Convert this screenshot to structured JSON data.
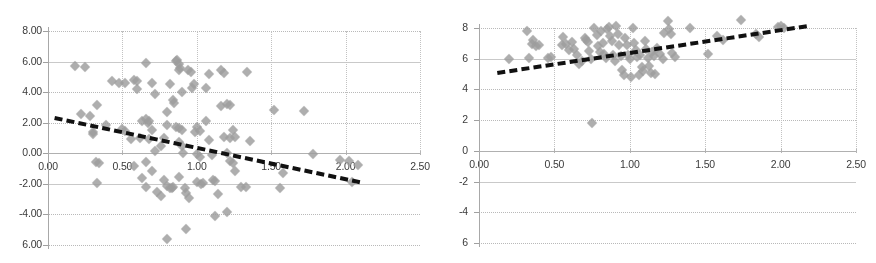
{
  "figure": {
    "type": "two-panel-scatter",
    "background": "#ffffff",
    "marker_color": "#9d9d9d",
    "trendline_color": "#111111",
    "gridline_color": "#b9b9b9"
  },
  "chart_data": [
    {
      "type": "scatter",
      "panel": "left",
      "title": "",
      "xlabel": "",
      "ylabel": "",
      "xlim": [
        0.0,
        2.5
      ],
      "ylim": [
        -6.0,
        8.0
      ],
      "grid": true,
      "legend": "none",
      "xticks": [
        "0.00",
        "0.50",
        "1.00",
        "1.50",
        "2.00",
        "2.50"
      ],
      "xtick_values": [
        0.0,
        0.5,
        1.0,
        1.5,
        2.0,
        2.5
      ],
      "yticks": [
        "8.00",
        "6.00",
        "4.00",
        "2.00",
        "0.00",
        "-2.00",
        "-4.00",
        "6.00"
      ],
      "ytick_values": [
        8,
        6,
        4,
        2,
        0,
        -2,
        -4,
        -6
      ],
      "trendline": {
        "x0": 0.05,
        "y0": 2.45,
        "x1": 2.1,
        "y1": -1.75,
        "style": "dashed",
        "slope": -2.05
      },
      "points": [
        [
          0.18,
          5.68
        ],
        [
          0.25,
          5.62
        ],
        [
          0.22,
          2.58
        ],
        [
          0.28,
          2.42
        ],
        [
          0.33,
          3.18
        ],
        [
          0.3,
          1.42
        ],
        [
          0.3,
          1.28
        ],
        [
          0.32,
          -0.55
        ],
        [
          0.34,
          -0.62
        ],
        [
          0.33,
          -1.95
        ],
        [
          0.39,
          1.85
        ],
        [
          0.43,
          4.72
        ],
        [
          0.48,
          4.58
        ],
        [
          0.52,
          4.62
        ],
        [
          0.5,
          1.62
        ],
        [
          0.52,
          1.45
        ],
        [
          0.56,
          0.95
        ],
        [
          0.58,
          4.78
        ],
        [
          0.6,
          4.72
        ],
        [
          0.6,
          4.18
        ],
        [
          0.62,
          1.02
        ],
        [
          0.63,
          -1.62
        ],
        [
          0.66,
          -2.22
        ],
        [
          0.58,
          -0.82
        ],
        [
          0.63,
          2.12
        ],
        [
          0.66,
          2.22
        ],
        [
          0.67,
          1.95
        ],
        [
          0.68,
          2.08
        ],
        [
          0.7,
          1.52
        ],
        [
          0.68,
          0.92
        ],
        [
          0.66,
          -0.55
        ],
        [
          0.7,
          -1.18
        ],
        [
          0.73,
          -2.52
        ],
        [
          0.76,
          -2.78
        ],
        [
          0.66,
          5.88
        ],
        [
          0.7,
          4.58
        ],
        [
          0.72,
          3.88
        ],
        [
          0.72,
          0.12
        ],
        [
          0.76,
          0.48
        ],
        [
          0.78,
          1.02
        ],
        [
          0.8,
          1.88
        ],
        [
          0.8,
          2.68
        ],
        [
          0.78,
          -1.72
        ],
        [
          0.8,
          -2.15
        ],
        [
          0.82,
          -2.25
        ],
        [
          0.83,
          -2.28
        ],
        [
          0.84,
          -2.18
        ],
        [
          0.8,
          -5.58
        ],
        [
          0.82,
          4.52
        ],
        [
          0.84,
          3.48
        ],
        [
          0.85,
          3.28
        ],
        [
          0.86,
          6.05
        ],
        [
          0.87,
          6.12
        ],
        [
          0.88,
          5.82
        ],
        [
          0.89,
          5.58
        ],
        [
          0.88,
          5.42
        ],
        [
          0.9,
          4.02
        ],
        [
          0.86,
          1.75
        ],
        [
          0.88,
          1.68
        ],
        [
          0.9,
          1.55
        ],
        [
          0.88,
          0.72
        ],
        [
          0.9,
          0.48
        ],
        [
          0.91,
          0.02
        ],
        [
          0.88,
          -1.58
        ],
        [
          0.92,
          -2.28
        ],
        [
          0.93,
          -2.62
        ],
        [
          0.95,
          -2.92
        ],
        [
          0.93,
          -4.98
        ],
        [
          0.94,
          5.48
        ],
        [
          0.96,
          5.32
        ],
        [
          0.98,
          4.52
        ],
        [
          0.97,
          4.28
        ],
        [
          0.99,
          1.42
        ],
        [
          1.0,
          1.72
        ],
        [
          1.02,
          1.48
        ],
        [
          1.0,
          -0.02
        ],
        [
          1.02,
          -0.22
        ],
        [
          1.0,
          -1.88
        ],
        [
          1.03,
          -2.02
        ],
        [
          1.04,
          -1.92
        ],
        [
          1.06,
          4.28
        ],
        [
          1.08,
          5.18
        ],
        [
          1.06,
          2.08
        ],
        [
          1.08,
          0.88
        ],
        [
          1.1,
          -0.12
        ],
        [
          1.11,
          -1.75
        ],
        [
          1.12,
          -1.82
        ],
        [
          1.14,
          -2.68
        ],
        [
          1.12,
          -4.12
        ],
        [
          1.16,
          5.42
        ],
        [
          1.18,
          5.28
        ],
        [
          1.16,
          3.12
        ],
        [
          1.2,
          3.22
        ],
        [
          1.22,
          3.18
        ],
        [
          1.18,
          1.08
        ],
        [
          1.22,
          1.02
        ],
        [
          1.24,
          1.52
        ],
        [
          1.26,
          1.08
        ],
        [
          1.2,
          0.05
        ],
        [
          1.22,
          -0.48
        ],
        [
          1.24,
          -0.62
        ],
        [
          1.26,
          -1.18
        ],
        [
          1.2,
          -3.82
        ],
        [
          1.3,
          -2.18
        ],
        [
          1.33,
          -2.22
        ],
        [
          1.36,
          0.82
        ],
        [
          1.34,
          5.32
        ],
        [
          1.52,
          2.82
        ],
        [
          1.56,
          -2.25
        ],
        [
          1.58,
          -1.32
        ],
        [
          1.72,
          2.75
        ],
        [
          1.78,
          -0.05
        ],
        [
          1.96,
          -0.42
        ],
        [
          2.02,
          -0.48
        ],
        [
          2.04,
          -1.88
        ],
        [
          2.08,
          -0.78
        ]
      ]
    },
    {
      "type": "scatter",
      "panel": "right",
      "title": "",
      "xlabel": "",
      "ylabel": "",
      "xlim": [
        0.0,
        2.5
      ],
      "ylim": [
        -6.0,
        8.0
      ],
      "grid": true,
      "legend": "none",
      "xticks": [
        "0.00",
        "0.50",
        "1.00",
        "1.50",
        "2.00",
        "2.50"
      ],
      "xtick_values": [
        0.0,
        0.5,
        1.0,
        1.5,
        2.0,
        2.5
      ],
      "yticks": [
        "8",
        "6",
        "4",
        "2",
        "0",
        "-2",
        "-4",
        "6"
      ],
      "ytick_values": [
        8,
        6,
        4,
        2,
        0,
        -2,
        -4,
        -6
      ],
      "trendline": {
        "x0": 0.12,
        "y0": 5.18,
        "x1": 2.17,
        "y1": 8.22,
        "style": "dashed",
        "slope": 1.48
      },
      "points": [
        [
          0.2,
          5.95
        ],
        [
          0.32,
          7.82
        ],
        [
          0.33,
          6.05
        ],
        [
          0.35,
          6.95
        ],
        [
          0.36,
          7.22
        ],
        [
          0.38,
          6.82
        ],
        [
          0.4,
          6.92
        ],
        [
          0.46,
          6.05
        ],
        [
          0.48,
          6.12
        ],
        [
          0.55,
          6.92
        ],
        [
          0.56,
          7.42
        ],
        [
          0.58,
          6.95
        ],
        [
          0.6,
          6.58
        ],
        [
          0.62,
          7.08
        ],
        [
          0.63,
          6.62
        ],
        [
          0.65,
          6.22
        ],
        [
          0.66,
          5.68
        ],
        [
          0.68,
          5.82
        ],
        [
          0.7,
          7.38
        ],
        [
          0.71,
          7.22
        ],
        [
          0.72,
          7.12
        ],
        [
          0.73,
          6.48
        ],
        [
          0.74,
          5.98
        ],
        [
          0.75,
          1.82
        ],
        [
          0.76,
          7.98
        ],
        [
          0.78,
          7.52
        ],
        [
          0.79,
          6.85
        ],
        [
          0.8,
          6.42
        ],
        [
          0.81,
          7.78
        ],
        [
          0.82,
          7.05
        ],
        [
          0.83,
          6.32
        ],
        [
          0.84,
          6.02
        ],
        [
          0.85,
          7.92
        ],
        [
          0.86,
          8.05
        ],
        [
          0.87,
          7.45
        ],
        [
          0.88,
          7.15
        ],
        [
          0.89,
          6.22
        ],
        [
          0.9,
          5.88
        ],
        [
          0.91,
          8.12
        ],
        [
          0.92,
          7.58
        ],
        [
          0.93,
          6.92
        ],
        [
          0.94,
          6.18
        ],
        [
          0.95,
          5.28
        ],
        [
          0.96,
          4.92
        ],
        [
          0.97,
          7.32
        ],
        [
          0.98,
          6.88
        ],
        [
          0.99,
          6.22
        ],
        [
          1.0,
          5.95
        ],
        [
          1.01,
          4.78
        ],
        [
          1.02,
          7.98
        ],
        [
          1.03,
          7.05
        ],
        [
          1.04,
          6.58
        ],
        [
          1.05,
          6.08
        ],
        [
          1.06,
          4.92
        ],
        [
          1.07,
          6.22
        ],
        [
          1.08,
          5.48
        ],
        [
          1.09,
          5.18
        ],
        [
          1.1,
          7.18
        ],
        [
          1.11,
          6.62
        ],
        [
          1.12,
          6.02
        ],
        [
          1.13,
          5.52
        ],
        [
          1.14,
          5.08
        ],
        [
          1.15,
          6.45
        ],
        [
          1.16,
          6.18
        ],
        [
          1.17,
          4.98
        ],
        [
          1.18,
          6.72
        ],
        [
          1.2,
          6.28
        ],
        [
          1.22,
          5.98
        ],
        [
          1.23,
          7.68
        ],
        [
          1.25,
          8.48
        ],
        [
          1.26,
          7.92
        ],
        [
          1.27,
          7.58
        ],
        [
          1.28,
          6.38
        ],
        [
          1.3,
          6.12
        ],
        [
          1.4,
          7.98
        ],
        [
          1.52,
          6.32
        ],
        [
          1.58,
          7.48
        ],
        [
          1.62,
          7.22
        ],
        [
          1.74,
          8.52
        ],
        [
          1.84,
          7.58
        ],
        [
          1.86,
          7.42
        ],
        [
          1.98,
          8.05
        ],
        [
          2.0,
          8.12
        ],
        [
          2.02,
          7.98
        ]
      ]
    }
  ]
}
